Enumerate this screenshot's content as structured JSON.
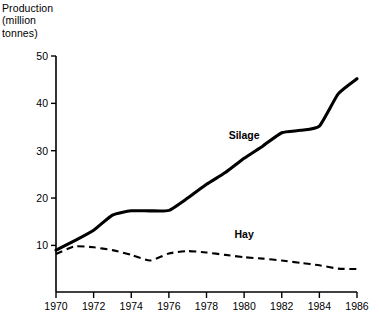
{
  "chart_data": {
    "type": "line",
    "title": "",
    "xlabel": "",
    "ylabel": "Production (million tonnes)",
    "ylabel_lines": [
      "Production",
      "(million",
      "tonnes)"
    ],
    "x": [
      1970,
      1971,
      1972,
      1973,
      1974,
      1975,
      1976,
      1977,
      1978,
      1979,
      1980,
      1981,
      1982,
      1983,
      1984,
      1985,
      1986
    ],
    "xlim": [
      1970,
      1986
    ],
    "ylim": [
      0,
      50
    ],
    "xticks": [
      1970,
      1972,
      1974,
      1976,
      1978,
      1980,
      1982,
      1984,
      1986
    ],
    "xtick_labels": [
      "1970",
      "1972",
      "1974",
      "1976",
      "1978",
      "1980",
      "1982",
      "1984",
      "1986"
    ],
    "yticks": [
      10,
      20,
      30,
      40,
      50
    ],
    "ytick_labels": [
      "10",
      "20",
      "30",
      "40",
      "50"
    ],
    "grid": false,
    "legend_position": "inline-annotations",
    "series": [
      {
        "name": "Silage",
        "style": "solid",
        "color": "#000000",
        "label_x": 1980.0,
        "label_y": 32.5,
        "values": [
          9.0,
          11.0,
          13.2,
          16.4,
          17.3,
          17.3,
          17.4,
          20.0,
          22.9,
          25.4,
          28.4,
          31.0,
          33.8,
          34.3,
          35.2,
          42.0,
          45.2
        ]
      },
      {
        "name": "Hay",
        "style": "dashed",
        "color": "#000000",
        "label_x": 1980.0,
        "label_y": 11.6,
        "values": [
          8.2,
          9.8,
          9.6,
          9.0,
          8.0,
          6.8,
          8.3,
          8.8,
          8.5,
          8.0,
          7.5,
          7.2,
          6.8,
          6.3,
          5.8,
          5.1,
          5.0
        ]
      }
    ]
  },
  "axis_title_text": "Production\n(million\ntonnes)"
}
